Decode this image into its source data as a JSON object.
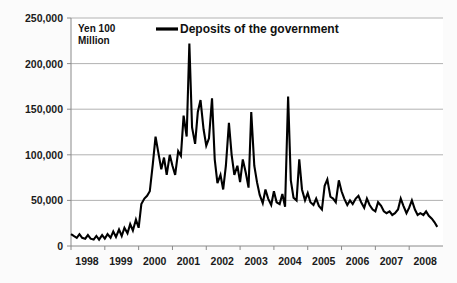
{
  "chart_data": {
    "type": "line",
    "title": "",
    "unit_label": "Yen 100\nMillion",
    "unit_label_line1": "Yen 100",
    "unit_label_line2": "Million",
    "xlabel": "",
    "ylabel": "",
    "ylim": [
      0,
      250000
    ],
    "xlim": [
      1998.0,
      2009.0
    ],
    "grid": true,
    "legend_position": "top-center-inside",
    "series": [
      {
        "name": "Deposits of the government",
        "color": "#000000",
        "x": [
          1998.0,
          1998.08,
          1998.17,
          1998.25,
          1998.33,
          1998.42,
          1998.5,
          1998.58,
          1998.67,
          1998.75,
          1998.83,
          1998.92,
          1999.0,
          1999.08,
          1999.17,
          1999.25,
          1999.33,
          1999.42,
          1999.5,
          1999.58,
          1999.67,
          1999.75,
          1999.83,
          1999.92,
          2000.0,
          2000.08,
          2000.17,
          2000.25,
          2000.33,
          2000.42,
          2000.5,
          2000.58,
          2000.67,
          2000.75,
          2000.83,
          2000.92,
          2001.0,
          2001.08,
          2001.17,
          2001.25,
          2001.33,
          2001.42,
          2001.5,
          2001.58,
          2001.67,
          2001.75,
          2001.83,
          2001.92,
          2002.0,
          2002.08,
          2002.17,
          2002.25,
          2002.33,
          2002.42,
          2002.5,
          2002.58,
          2002.67,
          2002.75,
          2002.83,
          2002.92,
          2003.0,
          2003.08,
          2003.17,
          2003.25,
          2003.33,
          2003.42,
          2003.5,
          2003.58,
          2003.67,
          2003.75,
          2003.83,
          2003.92,
          2004.0,
          2004.08,
          2004.17,
          2004.25,
          2004.33,
          2004.42,
          2004.5,
          2004.58,
          2004.67,
          2004.75,
          2004.83,
          2004.92,
          2005.0,
          2005.08,
          2005.17,
          2005.25,
          2005.33,
          2005.42,
          2005.5,
          2005.58,
          2005.67,
          2005.75,
          2005.83,
          2005.92,
          2006.0,
          2006.08,
          2006.17,
          2006.25,
          2006.33,
          2006.42,
          2006.5,
          2006.58,
          2006.67,
          2006.75,
          2006.83,
          2006.92,
          2007.0,
          2007.08,
          2007.17,
          2007.25,
          2007.33,
          2007.42,
          2007.5,
          2007.58,
          2007.67,
          2007.75,
          2007.83,
          2007.92,
          2008.0,
          2008.08,
          2008.17,
          2008.25,
          2008.33,
          2008.42,
          2008.5,
          2008.58,
          2008.67,
          2008.75,
          2008.83
        ],
        "values": [
          13000,
          11000,
          9000,
          13000,
          9000,
          8000,
          12000,
          8000,
          7000,
          11000,
          7000,
          12000,
          8000,
          13000,
          9000,
          16000,
          10000,
          18000,
          11000,
          20000,
          14000,
          24000,
          17000,
          29000,
          20000,
          46000,
          52000,
          55000,
          60000,
          90000,
          120000,
          103000,
          84000,
          97000,
          78000,
          100000,
          88000,
          78000,
          104000,
          99000,
          143000,
          120000,
          222000,
          130000,
          112000,
          147000,
          160000,
          128000,
          110000,
          118000,
          162000,
          95000,
          69000,
          78000,
          62000,
          88000,
          135000,
          100000,
          78000,
          88000,
          70000,
          95000,
          80000,
          64000,
          147000,
          88000,
          70000,
          56000,
          47000,
          62000,
          52000,
          45000,
          60000,
          48000,
          46000,
          57000,
          43000,
          164000,
          72000,
          53000,
          50000,
          95000,
          62000,
          50000,
          58000,
          48000,
          45000,
          52000,
          44000,
          40000,
          66000,
          73000,
          54000,
          52000,
          48000,
          72000,
          60000,
          52000,
          45000,
          50000,
          46000,
          52000,
          55000,
          48000,
          42000,
          52000,
          45000,
          40000,
          38000,
          48000,
          44000,
          38000,
          36000,
          38000,
          34000,
          36000,
          40000,
          52000,
          44000,
          36000,
          42000,
          50000,
          40000,
          34000,
          36000,
          34000,
          38000,
          33000,
          30000,
          26000,
          21000
        ]
      }
    ],
    "y_ticks": [
      {
        "value": 0,
        "label": "0"
      },
      {
        "value": 50000,
        "label": "50,000"
      },
      {
        "value": 100000,
        "label": "100,000"
      },
      {
        "value": 150000,
        "label": "150,000"
      },
      {
        "value": 200000,
        "label": "200,000"
      },
      {
        "value": 250000,
        "label": "250,000"
      }
    ],
    "x_ticks": [
      {
        "value": 1998,
        "label": "1998"
      },
      {
        "value": 1999,
        "label": "1999"
      },
      {
        "value": 2000,
        "label": "2000"
      },
      {
        "value": 2001,
        "label": "2001"
      },
      {
        "value": 2002,
        "label": "2002"
      },
      {
        "value": 2003,
        "label": "2003"
      },
      {
        "value": 2004,
        "label": "2004"
      },
      {
        "value": 2005,
        "label": "2005"
      },
      {
        "value": 2006,
        "label": "2006"
      },
      {
        "value": 2007,
        "label": "2007"
      },
      {
        "value": 2008,
        "label": "2008"
      }
    ],
    "legend": [
      {
        "label": "Deposits of the government",
        "color": "#000000"
      }
    ],
    "colors": {
      "series": "#000000",
      "gridline": "#a9a9a9",
      "axis": "#8a8a8a",
      "text": "#111111",
      "background": "#fbfbfb"
    }
  }
}
